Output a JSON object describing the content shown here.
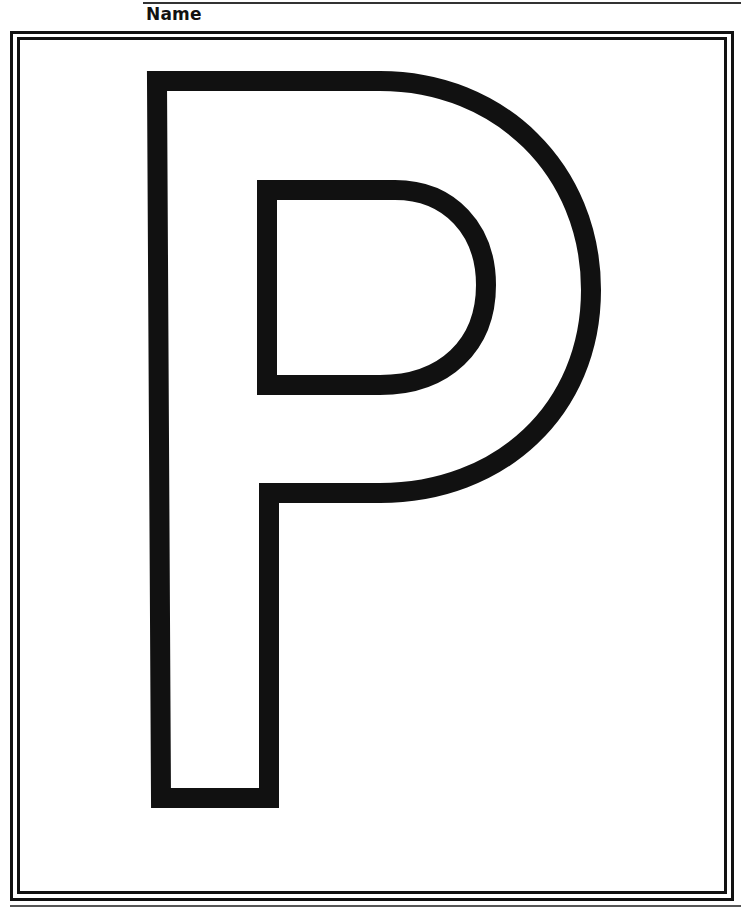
{
  "worksheet": {
    "name_label": "Name",
    "letter": "P",
    "letter_style": "outline",
    "ink_color": "#111111",
    "paper_color": "#ffffff"
  }
}
